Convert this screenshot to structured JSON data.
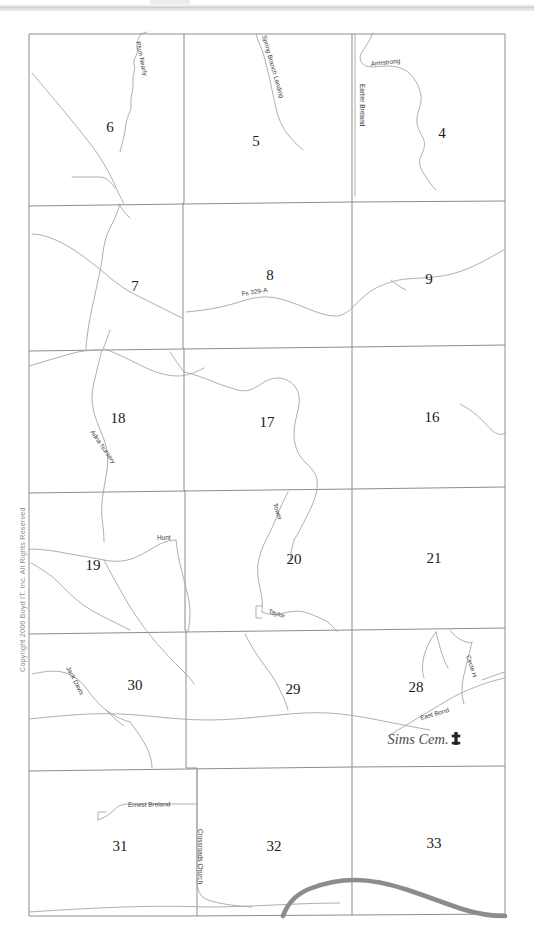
{
  "document": {
    "type": "scanned-plat-map",
    "copyright": "Copyright 2006 Boyd IT, Inc. All Rights Reserved",
    "background_color": "#ffffff",
    "grid_line_color": "#8d8d8d",
    "road_line_color": "#a8a8a8",
    "highway_color": "#8c8c8c"
  },
  "map": {
    "sections": [
      {
        "number": "6",
        "x": 110,
        "y": 132
      },
      {
        "number": "5",
        "x": 256,
        "y": 146
      },
      {
        "number": "4",
        "x": 442,
        "y": 138
      },
      {
        "number": "7",
        "x": 135,
        "y": 291
      },
      {
        "number": "8",
        "x": 270,
        "y": 280
      },
      {
        "number": "9",
        "x": 429,
        "y": 284
      },
      {
        "number": "18",
        "x": 118,
        "y": 423
      },
      {
        "number": "17",
        "x": 267,
        "y": 427
      },
      {
        "number": "16",
        "x": 432,
        "y": 422
      },
      {
        "number": "19",
        "x": 93,
        "y": 570
      },
      {
        "number": "20",
        "x": 294,
        "y": 564
      },
      {
        "number": "21",
        "x": 434,
        "y": 563
      },
      {
        "number": "30",
        "x": 135,
        "y": 690
      },
      {
        "number": "29",
        "x": 293,
        "y": 694
      },
      {
        "number": "28",
        "x": 416,
        "y": 692
      },
      {
        "number": "31",
        "x": 120,
        "y": 851
      },
      {
        "number": "32",
        "x": 274,
        "y": 851
      },
      {
        "number": "33",
        "x": 434,
        "y": 848
      }
    ],
    "road_labels": [
      {
        "text": "Plum Nearly",
        "x": 136,
        "y": 42,
        "rotate": 78
      },
      {
        "text": "Spring Branch Landing",
        "x": 262,
        "y": 36,
        "rotate": 74
      },
      {
        "text": "Armstrong",
        "x": 371,
        "y": 66,
        "rotate": -6
      },
      {
        "text": "Earlier Breland",
        "x": 360,
        "y": 84,
        "rotate": 90
      },
      {
        "text": "Fs 329-A",
        "x": 242,
        "y": 296,
        "rotate": -9
      },
      {
        "text": "Adna Nursery",
        "x": 90,
        "y": 432,
        "rotate": 55
      },
      {
        "text": "Hunt",
        "x": 157,
        "y": 540,
        "rotate": 0
      },
      {
        "text": "Tower",
        "x": 273,
        "y": 504,
        "rotate": 72
      },
      {
        "text": "Taylor",
        "x": 268,
        "y": 613,
        "rotate": 18
      },
      {
        "text": "Jack Davis",
        "x": 66,
        "y": 668,
        "rotate": 62
      },
      {
        "text": "East Bond",
        "x": 421,
        "y": 720,
        "rotate": -16
      },
      {
        "text": "Circle H",
        "x": 466,
        "y": 656,
        "rotate": 72
      },
      {
        "text": "Ernest Breland",
        "x": 128,
        "y": 807,
        "rotate": -1
      },
      {
        "text": "Crossroads Church",
        "x": 198,
        "y": 829,
        "rotate": 90
      }
    ],
    "points_of_interest": [
      {
        "label": "Sims Cem.",
        "icon": "cemetery-cross-icon",
        "x": 418,
        "y": 744
      }
    ],
    "grid": {
      "left": 29,
      "right": 505,
      "top": 34,
      "bottom": 916,
      "column_x": [
        29,
        184,
        352,
        505
      ],
      "row_y": [
        34,
        203,
        348,
        490,
        630,
        768,
        916
      ]
    }
  }
}
